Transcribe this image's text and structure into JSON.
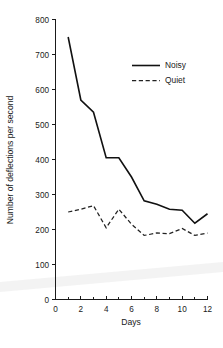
{
  "chart_data": {
    "type": "line",
    "title": "",
    "xlabel": "Days",
    "ylabel": "Number of deflections per second",
    "xlim": [
      0,
      12
    ],
    "ylim": [
      0,
      800
    ],
    "grid": false,
    "legend_position": "upper-right",
    "x": [
      1,
      2,
      3,
      4,
      5,
      6,
      7,
      8,
      9,
      10,
      11,
      12
    ],
    "xticks": [
      0,
      1,
      2,
      3,
      4,
      5,
      6,
      7,
      8,
      9,
      10,
      11,
      12
    ],
    "xtick_labels": [
      "0",
      "",
      "2",
      "",
      "4",
      "",
      "6",
      "",
      "8",
      "",
      "10",
      "",
      "12"
    ],
    "yticks": [
      0,
      100,
      200,
      300,
      400,
      500,
      600,
      700,
      800
    ],
    "ytick_labels": [
      "0",
      "100",
      "200",
      "300",
      "400",
      "500",
      "600",
      "700",
      "800"
    ],
    "series": [
      {
        "name": "Noisy",
        "style": "solid",
        "color": "#111111",
        "values": [
          750,
          570,
          535,
          405,
          405,
          350,
          282,
          272,
          258,
          255,
          218,
          245
        ]
      },
      {
        "name": "Quiet",
        "style": "dashed",
        "color": "#222222",
        "values": [
          250,
          258,
          268,
          205,
          258,
          215,
          183,
          190,
          188,
          203,
          183,
          190
        ]
      }
    ]
  },
  "axes": {
    "x_title": "Days",
    "y_title": "Number of deflections per second"
  },
  "legend": {
    "entries": [
      {
        "label": "Noisy",
        "style": "solid"
      },
      {
        "label": "Quiet",
        "style": "dashed"
      }
    ]
  },
  "colors": {
    "axis": "#1a1a1a",
    "noisy": "#111111",
    "quiet": "#222222",
    "background": "#ffffff",
    "scan_artifact": "#efefef"
  }
}
